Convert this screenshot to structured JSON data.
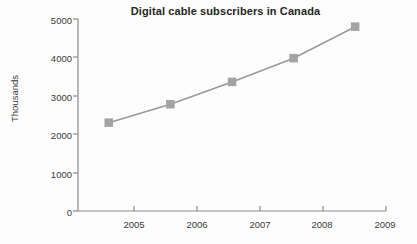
{
  "chart_data": {
    "type": "line",
    "title": "Digital cable subscribers in Canada",
    "xlabel": "",
    "ylabel": "Thousands",
    "x": [
      2004.5,
      2005.5,
      2006.5,
      2007.5,
      2008.5
    ],
    "values": [
      2300,
      2780,
      3360,
      3980,
      4800
    ],
    "series": [
      {
        "name": "Digital cable subscribers",
        "values": [
          2300,
          2780,
          3360,
          3980,
          4800
        ]
      }
    ],
    "xlim": [
      2004,
      2009
    ],
    "ylim": [
      0,
      5000
    ],
    "x_tick_labels": [
      "2005",
      "2006",
      "2007",
      "2008",
      "2009"
    ],
    "x_tick_values": [
      2005,
      2006,
      2007,
      2008,
      2009
    ],
    "y_tick_labels": [
      "0",
      "1000",
      "2000",
      "3000",
      "4000",
      "5000"
    ],
    "y_tick_values": [
      0,
      1000,
      2000,
      3000,
      4000,
      5000
    ],
    "grid": false,
    "legend": "none",
    "marker": "square",
    "line_color": "#9a9a9a",
    "marker_color": "#a3a3a3",
    "axis_color": "#8c8c8c",
    "title_color": "#262626",
    "background_color": "#fdfdfd"
  }
}
